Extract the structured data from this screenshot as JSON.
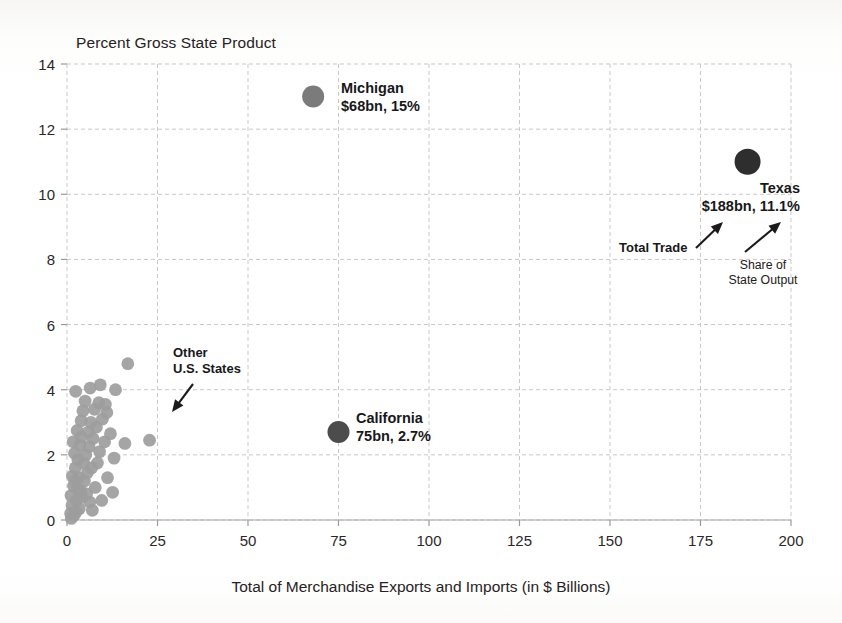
{
  "chart_data": {
    "type": "scatter",
    "title": "Percent Gross State Product",
    "xlabel": "Total of Merchandise Exports and Imports (in $ Billions)",
    "ylabel": "Percent Gross State Product",
    "xlim": [
      0,
      200
    ],
    "ylim": [
      0,
      14
    ],
    "xticks": [
      "0",
      "25",
      "50",
      "75",
      "100",
      "125",
      "150",
      "175",
      "200"
    ],
    "xtick_values": [
      0,
      25,
      50,
      75,
      100,
      125,
      150,
      175,
      200
    ],
    "yticks": [
      "0",
      "2",
      "4",
      "6",
      "8",
      "10",
      "12",
      "14"
    ],
    "ytick_values": [
      0,
      2,
      4,
      6,
      8,
      10,
      12,
      14
    ],
    "grid": true,
    "grid_style": "dashed",
    "grid_color": "#c9c9c9",
    "legend": "none",
    "marker_color_default": "#9d9d9d",
    "marker_color_highlight": "#6f6f6f",
    "marker_color_dark": "#4a4a4a",
    "marker_color_darkest": "#2b2b2b",
    "highlighted_points": [
      {
        "name": "Michigan",
        "x": 68,
        "y": 13.0,
        "r": 11,
        "color": "#7b7b7b",
        "label_line1": "Michigan",
        "label_line2": "$68bn, 15%",
        "label_x": 341,
        "label_y": 80,
        "align": "left"
      },
      {
        "name": "Texas",
        "x": 188,
        "y": 11.0,
        "r": 13,
        "color": "#2e2e2e",
        "label_line1": "Texas",
        "label_line2": "$188bn, 11.1%",
        "label_x": 800,
        "label_y": 180,
        "align": "right"
      },
      {
        "name": "California",
        "x": 75,
        "y": 2.7,
        "r": 11,
        "color": "#4c4c4c",
        "label_line1": "California",
        "label_line2": "75bn, 2.7%",
        "label_x": 356,
        "label_y": 410,
        "align": "left"
      }
    ],
    "annotations": [
      {
        "text_line1": "Other",
        "text_line2": "U.S. States",
        "x": 173,
        "y": 345,
        "align": "left"
      },
      {
        "text_line1": "Total Trade",
        "text_line2": "",
        "x": 619,
        "y": 240,
        "align": "left"
      },
      {
        "text_line1": "Share of",
        "text_line2": "State Output",
        "x": 763,
        "y": 258,
        "align": "center"
      }
    ],
    "other_states": [
      {
        "x": 1.0,
        "y": 0.2
      },
      {
        "x": 1.4,
        "y": 0.45
      },
      {
        "x": 2.0,
        "y": 0.15
      },
      {
        "x": 1.1,
        "y": 0.75
      },
      {
        "x": 2.6,
        "y": 0.6
      },
      {
        "x": 3.4,
        "y": 0.35
      },
      {
        "x": 1.8,
        "y": 1.05
      },
      {
        "x": 2.9,
        "y": 0.95
      },
      {
        "x": 4.2,
        "y": 0.7
      },
      {
        "x": 6.3,
        "y": 0.55
      },
      {
        "x": 1.5,
        "y": 1.35
      },
      {
        "x": 3.2,
        "y": 1.3
      },
      {
        "x": 4.8,
        "y": 1.2
      },
      {
        "x": 2.3,
        "y": 1.6
      },
      {
        "x": 5.6,
        "y": 1.45
      },
      {
        "x": 7.8,
        "y": 1.0
      },
      {
        "x": 9.6,
        "y": 0.6
      },
      {
        "x": 3.0,
        "y": 1.85
      },
      {
        "x": 4.6,
        "y": 1.75
      },
      {
        "x": 6.8,
        "y": 1.6
      },
      {
        "x": 2.1,
        "y": 2.05
      },
      {
        "x": 5.2,
        "y": 2.0
      },
      {
        "x": 8.4,
        "y": 1.75
      },
      {
        "x": 11.2,
        "y": 1.3
      },
      {
        "x": 3.6,
        "y": 2.3
      },
      {
        "x": 6.1,
        "y": 2.25
      },
      {
        "x": 9.0,
        "y": 2.1
      },
      {
        "x": 13.0,
        "y": 1.9
      },
      {
        "x": 4.0,
        "y": 2.55
      },
      {
        "x": 7.2,
        "y": 2.5
      },
      {
        "x": 10.4,
        "y": 2.4
      },
      {
        "x": 16.0,
        "y": 2.35
      },
      {
        "x": 22.8,
        "y": 2.45
      },
      {
        "x": 2.8,
        "y": 2.75
      },
      {
        "x": 5.9,
        "y": 2.7
      },
      {
        "x": 8.1,
        "y": 2.85
      },
      {
        "x": 12.0,
        "y": 2.65
      },
      {
        "x": 3.9,
        "y": 3.05
      },
      {
        "x": 6.6,
        "y": 3.0
      },
      {
        "x": 9.8,
        "y": 3.1
      },
      {
        "x": 4.4,
        "y": 3.35
      },
      {
        "x": 7.6,
        "y": 3.4
      },
      {
        "x": 11.0,
        "y": 3.3
      },
      {
        "x": 5.0,
        "y": 3.65
      },
      {
        "x": 8.8,
        "y": 3.6
      },
      {
        "x": 10.6,
        "y": 3.55
      },
      {
        "x": 2.4,
        "y": 3.95
      },
      {
        "x": 6.4,
        "y": 4.05
      },
      {
        "x": 9.2,
        "y": 4.15
      },
      {
        "x": 13.4,
        "y": 4.0
      },
      {
        "x": 16.8,
        "y": 4.8
      },
      {
        "x": 1.2,
        "y": 0.05
      },
      {
        "x": 2.5,
        "y": 0.25
      },
      {
        "x": 7.0,
        "y": 0.3
      },
      {
        "x": 12.6,
        "y": 0.85
      },
      {
        "x": 1.7,
        "y": 2.4
      },
      {
        "x": 2.2,
        "y": 1.2
      },
      {
        "x": 3.8,
        "y": 0.9
      },
      {
        "x": 5.4,
        "y": 0.8
      }
    ]
  }
}
